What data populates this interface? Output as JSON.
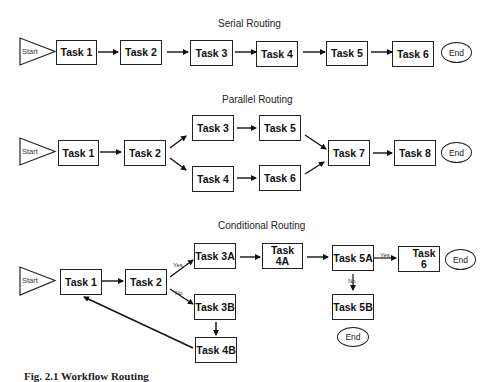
{
  "serial": {
    "title": "Serial Routing",
    "start": "Start",
    "tasks": [
      "Task 1",
      "Task 2",
      "Task 3",
      "Task 4",
      "Task 5",
      "Task 6"
    ],
    "end": "End"
  },
  "parallel": {
    "title": "Parallel Routing",
    "start": "Start",
    "tasks": [
      "Task 1",
      "Task 2",
      "Task 3",
      "Task 4",
      "Task 5",
      "Task 6",
      "Task 7",
      "Task 8"
    ],
    "end": "End"
  },
  "conditional": {
    "title": "Conditional Routing",
    "start": "Start",
    "tasks": {
      "t1": "Task 1",
      "t2": "Task 2",
      "t3a": "Task 3A",
      "t3b": "Task 3B",
      "t4a": "Task 4A",
      "t4b": "Task 4B",
      "t5a": "Task 5A",
      "t5b": "Task 5B",
      "t6": "Task 6"
    },
    "labels": {
      "yes1": "Yes",
      "no1": "No",
      "yes2": "Yes",
      "no2": "No"
    },
    "end1": "End",
    "end2": "End"
  },
  "caption": "Fig. 2.1 Workflow Routing"
}
